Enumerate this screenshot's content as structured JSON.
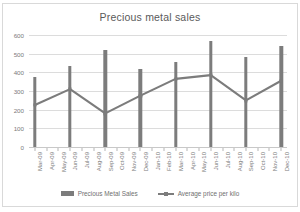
{
  "chart_data": {
    "type": "bar",
    "title": "Precious metal sales",
    "xlabel": "",
    "ylabel": "",
    "ylim": [
      0,
      600
    ],
    "yticks": [
      0,
      100,
      200,
      300,
      400,
      500,
      600
    ],
    "grid": true,
    "legend_position": "bottom",
    "categories": [
      "Mar-09",
      "Apr-09",
      "May-09",
      "Jun-09",
      "Jul-09",
      "Aug-09",
      "Sep-09",
      "Oct-09",
      "Nov-09",
      "Dec-09",
      "Jan-10",
      "Feb-10",
      "Mar-10",
      "Apr-10",
      "May-10",
      "Jun-10",
      "Jul-10",
      "Aug-10",
      "Sep-10",
      "Oct-10",
      "Nov-10",
      "Dec-10"
    ],
    "series": [
      {
        "name": "Precious Metal Sales",
        "type": "bar",
        "color": "#7c7c7c",
        "values": [
          375,
          null,
          null,
          435,
          null,
          null,
          517,
          null,
          null,
          418,
          null,
          null,
          455,
          null,
          null,
          570,
          null,
          null,
          482,
          null,
          null,
          542
        ]
      },
      {
        "name": "Average price per kilo",
        "type": "line",
        "color": "#7c7c7c",
        "values": [
          225,
          null,
          null,
          310,
          null,
          null,
          180,
          null,
          null,
          275,
          null,
          null,
          365,
          null,
          null,
          385,
          null,
          null,
          250,
          null,
          null,
          355
        ]
      }
    ]
  },
  "legend": {
    "items": [
      {
        "label": "Precious Metal Sales"
      },
      {
        "label": "Average price per kilo"
      }
    ]
  }
}
